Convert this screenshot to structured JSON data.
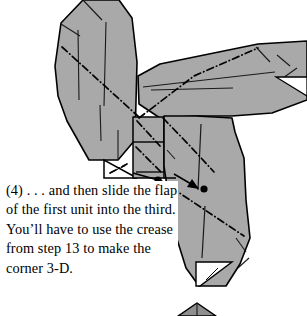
{
  "figure": {
    "kind": "origami-step-diagram",
    "step_number": "(4)",
    "colors": {
      "paper_gray": "#a9a9a9",
      "paper_gray_shade": "#9a9a9a",
      "paper_white": "#ffffff",
      "ink": "#000000",
      "background": "#ffffff"
    },
    "legend": {
      "dash_dot_line": "existing-crease-line",
      "solid_line": "paper-edge",
      "black_dot": "alignment-reference-point",
      "arrow": "insert-slide-direction"
    },
    "parts": [
      {
        "name": "left-arm-flap",
        "fill": "#a9a9a9"
      },
      {
        "name": "right-wing-flap",
        "fill": "#a9a9a9"
      },
      {
        "name": "lower-body-flap",
        "fill": "#a9a9a9"
      },
      {
        "name": "center-pocket-panel",
        "fill": "#a9a9a9"
      },
      {
        "name": "white-triangle-left",
        "fill": "#ffffff"
      },
      {
        "name": "white-triangle-lower",
        "fill": "#ffffff"
      },
      {
        "name": "white-triangle-right",
        "fill": "#ffffff"
      },
      {
        "name": "bottom-next-step-fragment",
        "fill": "#8f8f8f"
      }
    ],
    "markers": {
      "dot_count": 2,
      "arrow_count": 1
    }
  },
  "caption": {
    "text": "(4) . . . and then slide the flap of the first unit into the third.  You’ll have to use the crease from step 13 to make the corner 3-D."
  }
}
